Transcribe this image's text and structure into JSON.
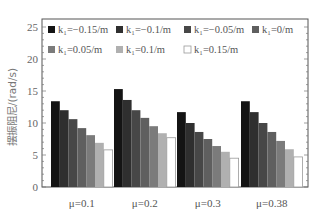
{
  "chart_data": {
    "type": "bar",
    "title": "",
    "xlabel": "",
    "ylabel": "摆振阻尼/(rad/s)",
    "ylim": [
      0,
      25
    ],
    "yticks": [
      0,
      5,
      10,
      15,
      20,
      25
    ],
    "grid": false,
    "legend_position": "top-inside, 4 columns x 2 rows",
    "categories": [
      "μ=0.1",
      "μ=0.2",
      "μ=0.3",
      "μ=0.38"
    ],
    "series": [
      {
        "name": "k₁=−0.15/m",
        "color": "#141414",
        "values": [
          13.4,
          15.3,
          11.7,
          13.4
        ]
      },
      {
        "name": "k₁=−0.1/m",
        "color": "#2f2f2f",
        "values": [
          12.0,
          13.6,
          10.0,
          11.7
        ]
      },
      {
        "name": "k₁=−0.05/m",
        "color": "#474747",
        "values": [
          10.6,
          12.0,
          8.6,
          10.0
        ]
      },
      {
        "name": "k₁=0/m",
        "color": "#5f5f5f",
        "values": [
          9.2,
          10.8,
          7.5,
          8.6
        ]
      },
      {
        "name": "k₁=0.05/m",
        "color": "#7b7b7b",
        "values": [
          8.1,
          9.5,
          6.4,
          7.2
        ]
      },
      {
        "name": "k₁=0.1/m",
        "color": "#b0b0b0",
        "values": [
          6.9,
          8.4,
          5.5,
          5.9
        ]
      },
      {
        "name": "k₁=0.15/m",
        "color": "#ffffff",
        "values": [
          5.8,
          7.7,
          4.5,
          4.7
        ]
      }
    ]
  }
}
